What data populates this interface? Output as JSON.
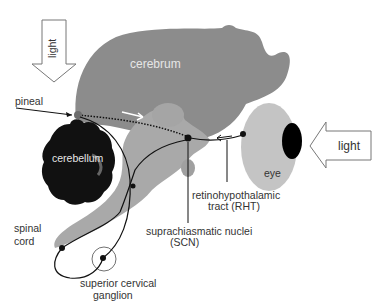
{
  "labels": {
    "light_top": "light",
    "light_right": "light",
    "cerebrum": "cerebrum",
    "pineal": "pineal",
    "cerebellum": "cerebellum",
    "eye": "eye",
    "spinal_cord_line1": "spinal",
    "spinal_cord_line2": "cord",
    "rht_line1": "retinohypothalamic",
    "rht_line2": "tract (RHT)",
    "scn_line1": "suprachiasmatic nuclei",
    "scn_line2": "(SCN)",
    "scg_line1": "superior cervical",
    "scg_line2": "ganglion"
  },
  "colors": {
    "brain": "#8c8c8c",
    "brainstem": "#a9a9a9",
    "cerebellum": "#111111",
    "eye": "#c4c4c4",
    "pupil": "#000000",
    "pathway": "#111111",
    "arrow_fill": "#ffffff",
    "arrow_stroke": "#777777"
  }
}
